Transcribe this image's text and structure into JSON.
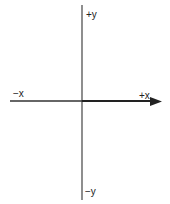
{
  "diagram": {
    "title": "",
    "labels": {
      "pos_y": "+y",
      "neg_y": "−y",
      "neg_x": "−x",
      "pos_x": "+x"
    },
    "colors": {
      "axis": "#333333",
      "text": "#222222"
    }
  }
}
